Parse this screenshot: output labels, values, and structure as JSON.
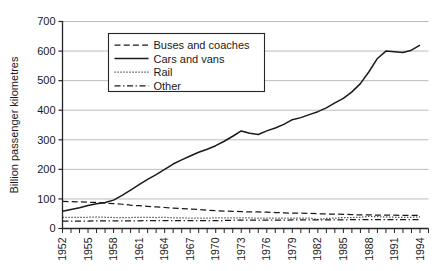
{
  "chart_data": {
    "type": "line",
    "title": "",
    "subtitle": "",
    "xlabel": "",
    "ylabel": "Billion passenger kilometres",
    "xlim": [
      1952,
      1995
    ],
    "ylim": [
      0,
      700
    ],
    "ytick_values": [
      0,
      100,
      200,
      300,
      400,
      500,
      600,
      700
    ],
    "ytick_labels": [
      "0",
      "100",
      "200",
      "300",
      "400",
      "500",
      "600",
      "700"
    ],
    "xtick_labels": [
      "1952",
      "1955",
      "1958",
      "1961",
      "1964",
      "1967",
      "1970",
      "1973",
      "1976",
      "1979",
      "1982",
      "1985",
      "1988",
      "1991",
      "1994"
    ],
    "xtick_minor_every_year": true,
    "grid": "horizontal",
    "grid_color": "#b4b4b4",
    "legend_position": "upper-left-inside",
    "x": [
      1952,
      1953,
      1954,
      1955,
      1956,
      1957,
      1958,
      1959,
      1960,
      1961,
      1962,
      1963,
      1964,
      1965,
      1966,
      1967,
      1968,
      1969,
      1970,
      1971,
      1972,
      1973,
      1974,
      1975,
      1976,
      1977,
      1978,
      1979,
      1980,
      1981,
      1982,
      1983,
      1984,
      1985,
      1986,
      1987,
      1988,
      1989,
      1990,
      1991,
      1992,
      1993,
      1994
    ],
    "series": [
      {
        "name": "Buses and coaches",
        "style": "dashed",
        "color": "#1a1a1a",
        "values": [
          92,
          91,
          90,
          89,
          88,
          86,
          84,
          82,
          79,
          77,
          75,
          73,
          71,
          69,
          67,
          66,
          64,
          62,
          60,
          59,
          58,
          57,
          56,
          56,
          55,
          54,
          53,
          52,
          52,
          51,
          50,
          49,
          49,
          48,
          47,
          46,
          46,
          45,
          45,
          45,
          44,
          44,
          44
        ]
      },
      {
        "name": "Cars and vans",
        "style": "solid",
        "color": "#1a1a1a",
        "values": [
          58,
          64,
          70,
          78,
          84,
          88,
          96,
          112,
          130,
          148,
          166,
          182,
          200,
          218,
          232,
          245,
          258,
          268,
          280,
          295,
          312,
          330,
          322,
          318,
          330,
          340,
          352,
          368,
          375,
          385,
          395,
          408,
          425,
          440,
          462,
          490,
          530,
          575,
          600,
          598,
          595,
          603,
          620
        ]
      },
      {
        "name": "Rail",
        "style": "dotted",
        "color": "#1a1a1a",
        "values": [
          38,
          38,
          38,
          38,
          39,
          38,
          37,
          37,
          37,
          38,
          38,
          37,
          38,
          36,
          36,
          35,
          35,
          35,
          36,
          36,
          36,
          36,
          36,
          35,
          35,
          35,
          35,
          35,
          35,
          35,
          31,
          34,
          35,
          37,
          37,
          38,
          41,
          40,
          39,
          38,
          38,
          38,
          39
        ]
      },
      {
        "name": "Other",
        "style": "dashdot",
        "color": "#1a1a1a",
        "values": [
          25,
          25,
          25,
          25,
          26,
          26,
          26,
          26,
          26,
          26,
          27,
          27,
          27,
          27,
          27,
          27,
          27,
          27,
          27,
          27,
          28,
          28,
          28,
          28,
          28,
          28,
          28,
          29,
          29,
          29,
          29,
          29,
          29,
          29,
          30,
          30,
          30,
          30,
          30,
          30,
          30,
          30,
          30
        ]
      }
    ]
  },
  "legend": {
    "items": [
      {
        "label": "Buses and coaches",
        "style": "dashed"
      },
      {
        "label": "Cars and vans",
        "style": "solid"
      },
      {
        "label": "Rail",
        "style": "dotted"
      },
      {
        "label": "Other",
        "style": "dashdot"
      }
    ]
  },
  "axes": {
    "y_axis_title": "Billion passenger kilometres"
  }
}
